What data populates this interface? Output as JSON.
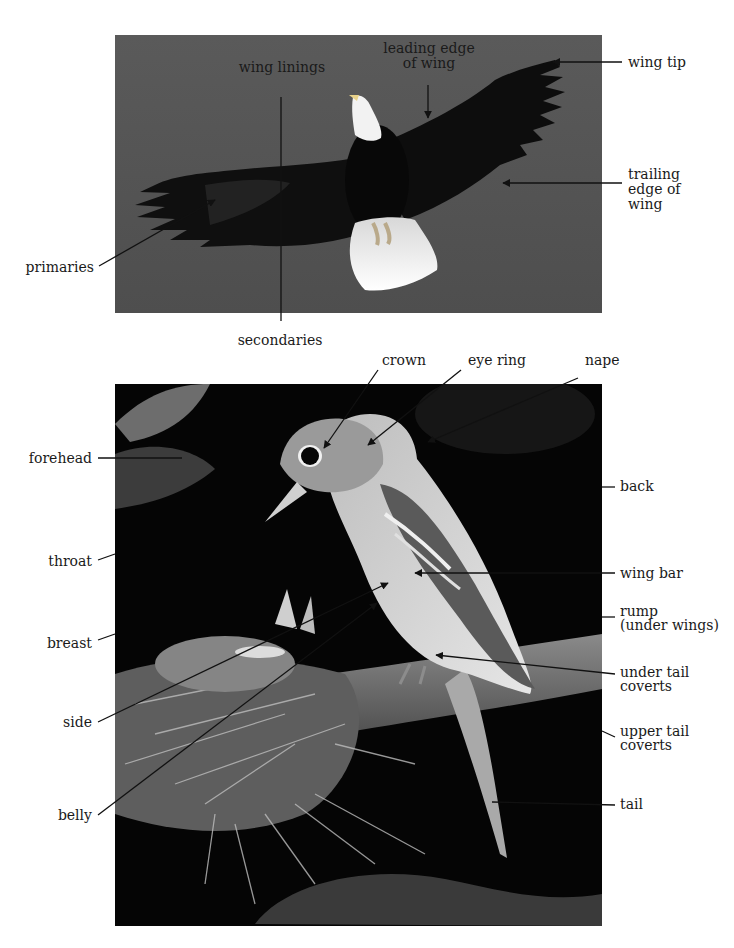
{
  "figure": {
    "eagle": {
      "subject": "bald eagle in flight, viewed from below",
      "background_color": "#555555",
      "labels": {
        "wing_linings": "wing linings",
        "leading_edge": "leading edge\nof wing",
        "wing_tip": "wing tip",
        "trailing_edge": "trailing\nedge of\nwing",
        "primaries": "primaries",
        "secondaries": "secondaries"
      }
    },
    "songbird": {
      "subject": "flycatcher perched at nest with nestlings",
      "background_color": "#050505",
      "labels": {
        "crown": "crown",
        "eye_ring": "eye ring",
        "nape": "nape",
        "forehead": "forehead",
        "throat": "throat",
        "breast": "breast",
        "side": "side",
        "belly": "belly",
        "back": "back",
        "wing_bar": "wing bar",
        "rump": "rump\n(under wings)",
        "under_tail_coverts": "under tail\ncoverts",
        "upper_tail_coverts": "upper tail\ncoverts",
        "tail": "tail"
      }
    },
    "colors": {
      "label_text": "#1a1a1a",
      "leader_line": "#111111",
      "page_background": "#ffffff"
    }
  }
}
